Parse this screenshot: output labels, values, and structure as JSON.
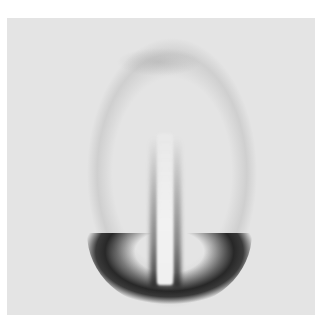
{
  "image": {
    "description": "Grayscale scattering/diffraction pattern with dark crescent at bottom and pale vertical beam-stop shadow flanked by darker streaks",
    "colors": {
      "background": "#ffffff",
      "plate": "#e4e4e4",
      "dark_arc": "#1e1e1e",
      "beamstop": "#f2f2f2"
    }
  }
}
